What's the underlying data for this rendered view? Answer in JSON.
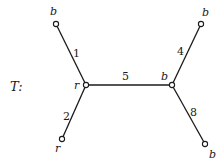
{
  "tree": {
    "name": "T:",
    "nodes": [
      {
        "id": "n1",
        "label": "b",
        "x": 56,
        "y": 24
      },
      {
        "id": "n2",
        "label": "r",
        "x": 86,
        "y": 85
      },
      {
        "id": "n3",
        "label": "r",
        "x": 62,
        "y": 139
      },
      {
        "id": "n4",
        "label": "b",
        "x": 172,
        "y": 85
      },
      {
        "id": "n5",
        "label": "b",
        "x": 201,
        "y": 24
      },
      {
        "id": "n6",
        "label": "b",
        "x": 205,
        "y": 144
      }
    ],
    "edges": [
      {
        "from": "n1",
        "to": "n2",
        "weight": "1"
      },
      {
        "from": "n2",
        "to": "n3",
        "weight": "2"
      },
      {
        "from": "n2",
        "to": "n4",
        "weight": "5"
      },
      {
        "from": "n4",
        "to": "n5",
        "weight": "4"
      },
      {
        "from": "n4",
        "to": "n6",
        "weight": "8"
      }
    ]
  }
}
